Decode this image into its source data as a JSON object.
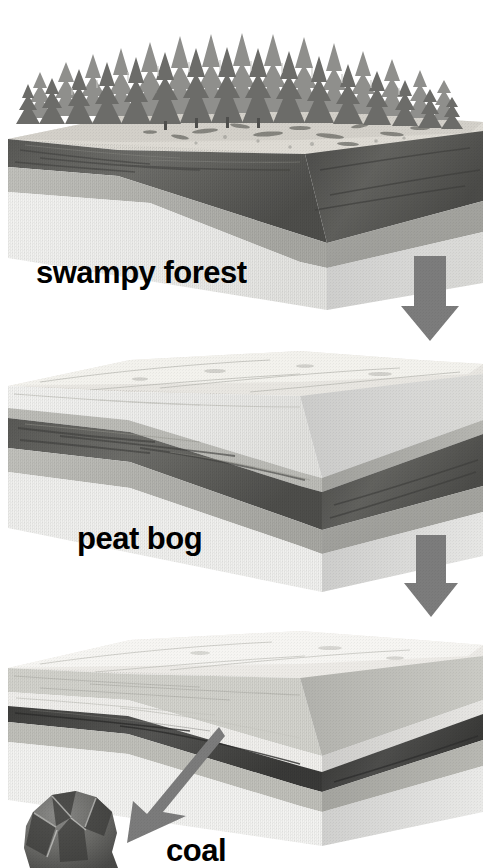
{
  "diagram": {
    "background_color": "#ffffff",
    "stages": [
      {
        "id": "swampy-forest",
        "label": "swampy forest",
        "order": 1,
        "features": [
          "conifer forest",
          "swamp surface",
          "organic dark layer",
          "sediment layers"
        ]
      },
      {
        "id": "peat-bog",
        "label": "peat bog",
        "order": 2,
        "features": [
          "buried peat layer",
          "overlying sediment",
          "compaction"
        ]
      },
      {
        "id": "coal",
        "label": "coal",
        "order": 3,
        "features": [
          "thin dark coal seam",
          "thick overburden",
          "coal lump specimen"
        ]
      }
    ],
    "connectors": [
      {
        "id": "arrow-1",
        "from": "swampy-forest",
        "to": "peat-bog",
        "direction": "down",
        "color": "#7c7c7c"
      },
      {
        "id": "arrow-2",
        "from": "peat-bog",
        "to": "coal",
        "direction": "down",
        "color": "#7c7c7c"
      },
      {
        "id": "arrow-3",
        "from": "coal-seam",
        "to": "coal-lump",
        "direction": "down-left",
        "color": "#7b7b7b"
      }
    ],
    "colors": {
      "arrow_gray": "#7c7c7c",
      "top_surface_light": "#ededea",
      "top_surface_mid": "#d9d9d4",
      "organic_dark": "#5f5f5c",
      "sediment_mid": "#b9b9b4",
      "sediment_pale": "#e9e9e6",
      "sediment_white": "#f4f4f2",
      "coal_seam": "#4a4a48",
      "coal_lump": "#6a6a68",
      "tree_dark": "#6e6e6c",
      "tree_mid": "#9a9a98",
      "text_black": "#000000"
    }
  }
}
